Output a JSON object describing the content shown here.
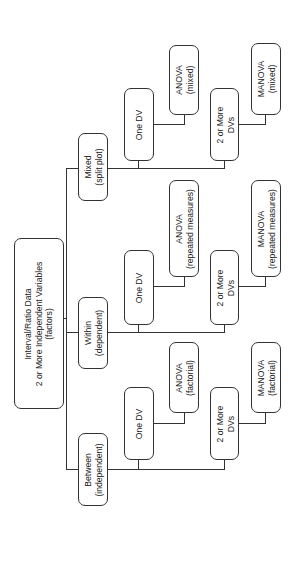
{
  "diagram": {
    "root": {
      "lines": [
        "Interval/Ratio Data",
        "2 or More Independent Variables",
        "(factors)"
      ]
    },
    "branches": [
      {
        "key": "mixed",
        "label": [
          "Mixed",
          "(split plot)"
        ],
        "one_dv": [
          "One DV"
        ],
        "one_dv_result": [
          "ANOVA",
          "(mixed)"
        ],
        "multi_dv": [
          "2 or More",
          "DVs"
        ],
        "multi_dv_result": [
          "MANOVA",
          "(mixed)"
        ]
      },
      {
        "key": "within",
        "label": [
          "Within",
          "(dependent)"
        ],
        "one_dv": [
          "One DV"
        ],
        "one_dv_result": [
          "ANOVA",
          "(repeated measures)"
        ],
        "multi_dv": [
          "2 or More",
          "DVs"
        ],
        "multi_dv_result": [
          "MANOVA",
          "(repeated measures)"
        ]
      },
      {
        "key": "between",
        "label": [
          "Between",
          "(independent)"
        ],
        "one_dv": [
          "One DV"
        ],
        "one_dv_result": [
          "ANOVA",
          "(factorial)"
        ],
        "multi_dv": [
          "2 or More",
          "DVs"
        ],
        "multi_dv_result": [
          "MANOVA",
          "(factorial)"
        ]
      }
    ]
  }
}
